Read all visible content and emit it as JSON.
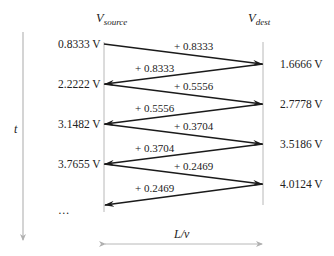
{
  "diagram": {
    "type": "bounce-diagram",
    "headers": {
      "source": {
        "main": "V",
        "sub": "source"
      },
      "dest": {
        "main": "V",
        "sub": "dest"
      }
    },
    "time_axis_label": "t",
    "span_label": "L/v",
    "source_levels": [
      "0.8333 V",
      "2.2222 V",
      "3.1482 V",
      "3.7655 V",
      "…"
    ],
    "dest_levels": [
      "1.6666 V",
      "2.7778 V",
      "3.5186 V",
      "4.0124 V"
    ],
    "increments": [
      {
        "label": "+ 0.8333",
        "direction": "to-dest"
      },
      {
        "label": "+ 0.8333",
        "direction": "to-source"
      },
      {
        "label": "+ 0.5556",
        "direction": "to-dest"
      },
      {
        "label": "+ 0.5556",
        "direction": "to-source"
      },
      {
        "label": "+ 0.3704",
        "direction": "to-dest"
      },
      {
        "label": "+ 0.3704",
        "direction": "to-source"
      },
      {
        "label": "+ 0.2469",
        "direction": "to-dest"
      },
      {
        "label": "+ 0.2469",
        "direction": "to-source"
      }
    ],
    "colors": {
      "line": "#1a1a1a",
      "axis": "#b8b8b8",
      "text": "#222222"
    }
  }
}
